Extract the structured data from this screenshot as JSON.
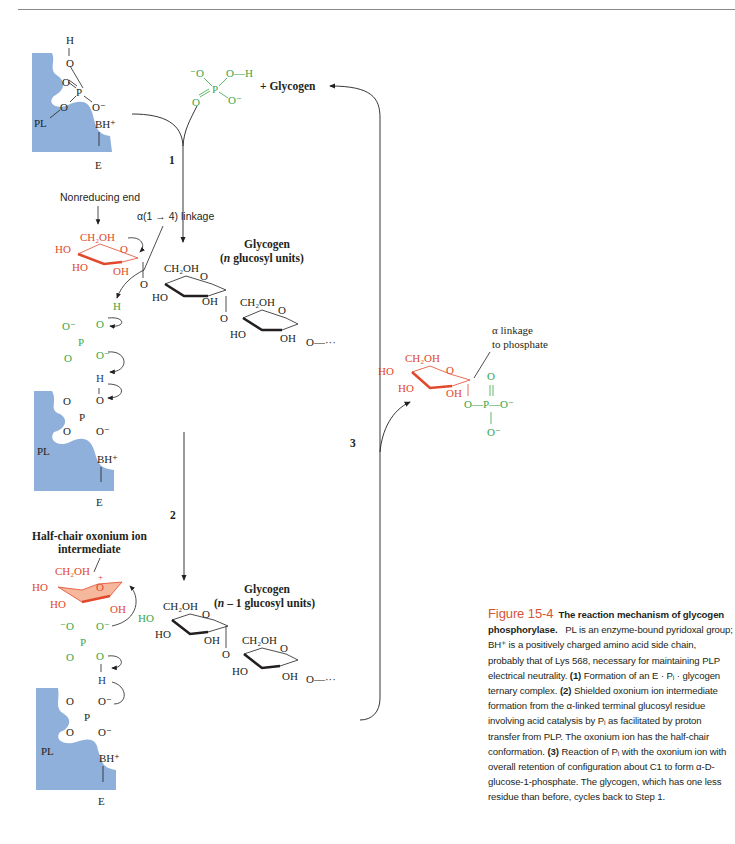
{
  "header": {
    "running_head": "... Glycogen Metabolism ... page"
  },
  "colors": {
    "enzyme_fill": "#8fb0da",
    "phosphate_green": "#3aa548",
    "glucose_red": "#e2492c",
    "proton_blue": "#1f3a78",
    "caption_figure_number": "#d2553a",
    "line_black": "#231f20"
  },
  "diagram": {
    "steps": [
      "1",
      "2",
      "3"
    ],
    "enzyme_state_1": {
      "enzyme_label": "E",
      "pl_label": "PL",
      "base_label": "BH+",
      "phosphate_atoms": {
        "o_double": "O",
        "p": "P",
        "o_h": "O",
        "h": "H",
        "o_minus": "O⁻",
        "o_pl": "O"
      }
    },
    "phosphate_substrate": {
      "o_minus_left": "⁻O",
      "p": "P",
      "o_h": "O—H",
      "o_double": "O",
      "o_minus": "O⁻"
    },
    "glycogen_product_label": "+ Glycogen",
    "labels": {
      "nonreducing_end": "Nonreducing end",
      "alpha_linkage": "α(1 → 4) linkage",
      "glycogen_n_title": "Glycogen",
      "glycogen_n_sub": "(n glucosyl units)",
      "glycogen_n1_title": "Glycogen",
      "glycogen_n1_sub": "(n – 1 glucosyl units)",
      "half_chair_line1": "Half-chair oxonium ion",
      "half_chair_line2": "intermediate",
      "alpha_phosphate_line1": "α linkage",
      "alpha_phosphate_line2": "to phosphate"
    },
    "sugar_labels": {
      "ch2oh": "CH₂OH",
      "ho": "HO",
      "oh": "OH",
      "o": "O",
      "ellipsis": "O—···"
    }
  },
  "caption": {
    "figure_number": "Figure 15-4",
    "title": "The reaction mechanism of glycogen phosphorylase.",
    "body": [
      "PL is an enzyme-bound pyridoxal group; BH⁺ is a positively charged amino acid side chain, probably that of Lys 568, necessary for maintaining PLP electrical neutrality.",
      "(1)",
      " Formation of an E · Pᵢ · glycogen ternary complex. ",
      "(2)",
      " Shielded oxonium ion intermediate formation from the α-linked terminal glucosyl residue involving acid catalysis by Pᵢ as facilitated by proton transfer from PLP. The oxonium ion has the half-chair conformation. ",
      "(3)",
      " Reaction of Pᵢ with the oxonium ion with overall retention of configuration about C1 to form α-D-glucose-1-phosphate. The glycogen, which has one less residue than before, cycles back to Step 1."
    ]
  }
}
